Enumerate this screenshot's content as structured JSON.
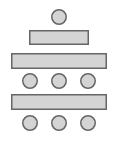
{
  "diagram": {
    "colors": {
      "background": "#ffffff",
      "fill": "#d4d4d4",
      "stroke": "#666666"
    },
    "stroke_width": 1.5,
    "shapes": [
      {
        "id": "head-seat",
        "type": "circle",
        "cx": 59,
        "cy": 17,
        "d": 16
      },
      {
        "id": "head-table",
        "type": "rect",
        "x": 29,
        "y": 30,
        "w": 60,
        "h": 15
      },
      {
        "id": "table-1",
        "type": "rect",
        "x": 11,
        "y": 53,
        "w": 96,
        "h": 16
      },
      {
        "id": "seat-row-1-left",
        "type": "circle",
        "cx": 30,
        "cy": 81,
        "d": 16
      },
      {
        "id": "seat-row-1-center",
        "type": "circle",
        "cx": 59,
        "cy": 81,
        "d": 16
      },
      {
        "id": "seat-row-1-right",
        "type": "circle",
        "cx": 88,
        "cy": 81,
        "d": 16
      },
      {
        "id": "table-2",
        "type": "rect",
        "x": 11,
        "y": 94,
        "w": 96,
        "h": 16
      },
      {
        "id": "seat-row-2-left",
        "type": "circle",
        "cx": 30,
        "cy": 123,
        "d": 16
      },
      {
        "id": "seat-row-2-center",
        "type": "circle",
        "cx": 59,
        "cy": 123,
        "d": 16
      },
      {
        "id": "seat-row-2-right",
        "type": "circle",
        "cx": 88,
        "cy": 123,
        "d": 16
      }
    ]
  }
}
